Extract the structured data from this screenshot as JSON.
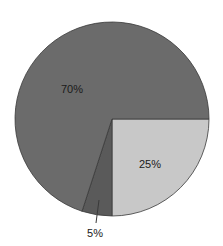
{
  "chart_data": {
    "type": "pie",
    "title": "",
    "categories": [
      "70%",
      "25%",
      "5%"
    ],
    "values": [
      70,
      25,
      5
    ],
    "labels": [
      "70%",
      "25%",
      "5%"
    ],
    "colors": [
      "#6b6b6b",
      "#c8c8c8",
      "#5a5a5a"
    ],
    "start_angle_deg": 0,
    "direction": "clockwise",
    "slice_order": [
      "25%",
      "5%",
      "70%"
    ],
    "legend": null,
    "annotations": [
      {
        "text": "5%",
        "type": "leader-line-label"
      }
    ]
  },
  "pie": {
    "center_x": 112,
    "center_y": 119,
    "radius": 97,
    "stroke_color": "#3a3a3a",
    "slices": [
      {
        "name": "slice-25",
        "value": 25,
        "label": "25%",
        "color": "#c8c8c8",
        "label_x": 150,
        "label_y": 168
      },
      {
        "name": "slice-5",
        "value": 5,
        "label": "5%",
        "color": "#5a5a5a",
        "label_x": 95,
        "label_y": 237
      },
      {
        "name": "slice-70",
        "value": 70,
        "label": "70%",
        "color": "#6b6b6b",
        "label_x": 72,
        "label_y": 93
      }
    ],
    "leader_line": {
      "x1": 99,
      "y1": 200,
      "x2": 96,
      "y2": 223
    }
  }
}
